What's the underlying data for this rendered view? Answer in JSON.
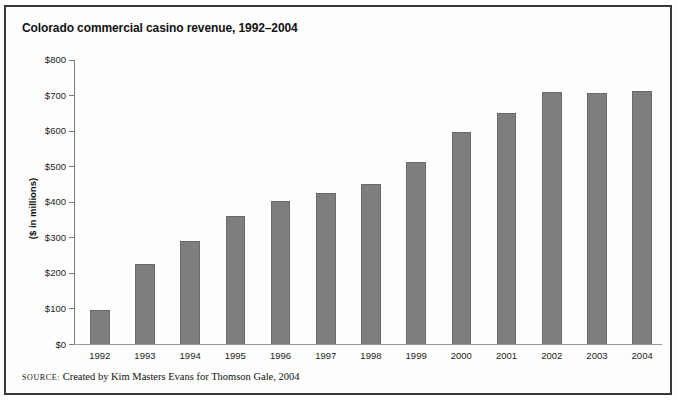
{
  "figure": {
    "label": "FIGURE"
  },
  "chart_data": {
    "type": "bar",
    "title": "Colorado commercial casino revenue, 1992–2004",
    "ylabel": "($ in millions)",
    "xlabel": "",
    "categories": [
      "1992",
      "1993",
      "1994",
      "1995",
      "1996",
      "1997",
      "1998",
      "1999",
      "2000",
      "2001",
      "2002",
      "2003",
      "2004"
    ],
    "values": [
      95,
      225,
      290,
      360,
      403,
      425,
      450,
      513,
      595,
      650,
      710,
      706,
      711
    ],
    "ylim": [
      0,
      800
    ],
    "ytick_step": 100,
    "ytick_labels": [
      "$0",
      "$100",
      "$200",
      "$300",
      "$400",
      "$500",
      "$600",
      "$700",
      "$800"
    ],
    "grid": false,
    "legend": "none",
    "colors": {
      "bar_fill": "#7e7e7e",
      "bar_edge": "#6a6a6a",
      "axis": "#7d7d7d",
      "baseline": "#9a9a9a",
      "text": "#1c1c1c",
      "frame_border": "#3a3a3a"
    }
  },
  "source": {
    "label": "SOURCE:",
    "text": " Created by Kim Masters Evans for Thomson Gale, 2004"
  }
}
